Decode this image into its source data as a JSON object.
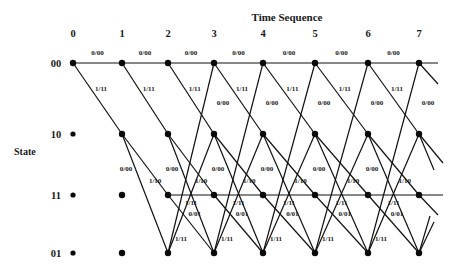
{
  "diagram": {
    "title": "Time Sequence",
    "y_axis_label": "State",
    "time_steps": [
      "0",
      "1",
      "2",
      "3",
      "4",
      "5",
      "6",
      "7"
    ],
    "column_x": [
      73,
      122,
      168,
      214,
      263,
      315,
      368,
      419
    ],
    "states": [
      {
        "label": "00",
        "y": 63
      },
      {
        "label": "10",
        "y": 134
      },
      {
        "label": "11",
        "y": 195
      },
      {
        "label": "01",
        "y": 253
      }
    ],
    "transitions": [
      {
        "from": "00",
        "to": "00",
        "label": "0/00"
      },
      {
        "from": "00",
        "to": "10",
        "label": "1/11"
      },
      {
        "from": "10",
        "to": "01",
        "label": "0/00"
      },
      {
        "from": "10",
        "to": "11",
        "label": "1/10"
      },
      {
        "from": "11",
        "to": "11",
        "label": "1/11"
      },
      {
        "from": "11",
        "to": "01",
        "label": "0/01"
      },
      {
        "from": "01",
        "to": "00",
        "label": "0/00"
      },
      {
        "from": "01",
        "to": "10",
        "label": "1/11"
      }
    ],
    "edge_labels": {
      "e00_00": "0/00",
      "e00_10": "1/11",
      "e10_01": "0/00",
      "e10_11": "1/10",
      "e11_11": "1/11",
      "e11_01": "0/01",
      "e01_00": "0/00",
      "e01_10": "1/11"
    }
  }
}
